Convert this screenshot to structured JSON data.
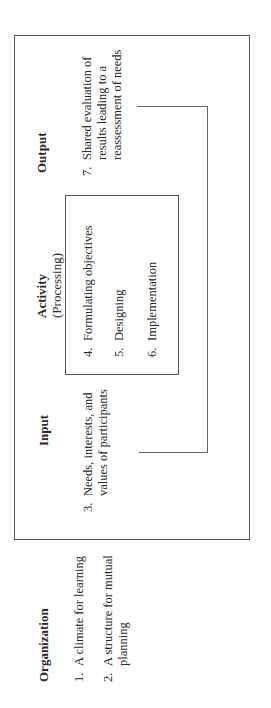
{
  "diagram": {
    "orientation": "rotated 90 degrees counter-clockwise",
    "columns": [
      {
        "heading": "Organization",
        "items": [
          {
            "num": "1.",
            "text": "A climate for learning"
          },
          {
            "num": "2.",
            "text": "A structure for mutual",
            "text2": "planning"
          }
        ]
      },
      {
        "heading": "Input",
        "items": [
          {
            "num": "3.",
            "text": "Needs, interests, and",
            "text2": "values of participants"
          }
        ]
      },
      {
        "heading": "Activity",
        "subheading": "(Processing)",
        "items": [
          {
            "num": "4.",
            "text": "Formulating objectives"
          },
          {
            "num": "5.",
            "text": "Designing"
          },
          {
            "num": "6.",
            "text": "Implementation"
          }
        ]
      },
      {
        "heading": "Output",
        "items": [
          {
            "num": "7.",
            "text": "Shared evaluation of",
            "text2": "results leading to a",
            "text3": "reassessment of needs"
          }
        ]
      }
    ],
    "feedback_loop": "from Output item 7 back to Input item 3"
  }
}
